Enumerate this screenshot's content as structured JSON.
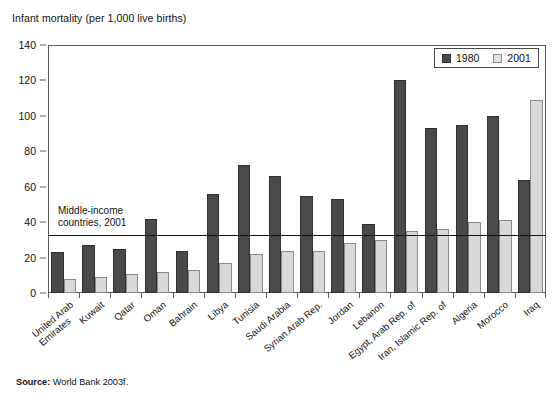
{
  "chart_data": {
    "type": "bar",
    "title": "Infant mortality (per 1,000 live births)",
    "xlabel": "",
    "ylabel": "",
    "ylim": [
      0,
      140
    ],
    "yticks": [
      0,
      20,
      40,
      60,
      80,
      100,
      120,
      140
    ],
    "grid": false,
    "legend_position": "top-right",
    "categories": [
      "United Arab Emirates",
      "Kuwait",
      "Qatar",
      "Oman",
      "Bahrain",
      "Libya",
      "Tunisia",
      "Saudi Arabia",
      "Syrian Arab Rep.",
      "Jordan",
      "Lebanon",
      "Egypt, Arab Rep. of",
      "Iran, Islamic Rep. of",
      "Algeria",
      "Morocco",
      "Iraq"
    ],
    "category_lines": [
      [
        "United Arab",
        "Emirates"
      ],
      [
        "Kuwait"
      ],
      [
        "Qatar"
      ],
      [
        "Oman"
      ],
      [
        "Bahrain"
      ],
      [
        "Libya"
      ],
      [
        "Tunisia"
      ],
      [
        "Saudi Arabia"
      ],
      [
        "Syrian Arab Rep."
      ],
      [
        "Jordan"
      ],
      [
        "Lebanon"
      ],
      [
        "Egypt, Arab Rep. of"
      ],
      [
        "Iran, Islamic Rep. of"
      ],
      [
        "Algeria"
      ],
      [
        "Morocco"
      ],
      [
        "Iraq"
      ]
    ],
    "series": [
      {
        "name": "1980",
        "color": "#4a4a4a",
        "values": [
          23,
          27,
          25,
          42,
          24,
          56,
          72,
          66,
          55,
          53,
          39,
          120,
          93,
          95,
          100,
          64
        ]
      },
      {
        "name": "2001",
        "color": "#d9d9d9",
        "values": [
          8,
          9,
          11,
          12,
          13,
          17,
          22,
          24,
          24,
          28,
          30,
          35,
          36,
          40,
          41,
          109
        ]
      }
    ],
    "annotations": [
      {
        "name": "middle-income-reference-line",
        "type": "hline",
        "value": 33,
        "text_lines": [
          "Middle-income",
          "countries, 2001"
        ]
      }
    ]
  },
  "legend": {
    "items": [
      {
        "label": "1980",
        "swatch": "dark-gray-swatch"
      },
      {
        "label": "2001",
        "swatch": "light-gray-swatch"
      }
    ]
  },
  "source": {
    "label": "Source:",
    "text": " World Bank 2003f."
  }
}
